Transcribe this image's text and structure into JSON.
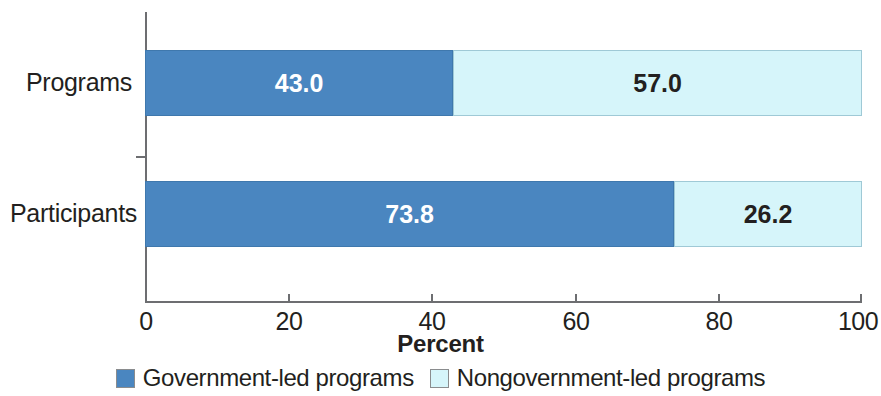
{
  "chart_data": {
    "type": "bar",
    "orientation": "horizontal",
    "stacked": true,
    "title": "",
    "xlabel": "Percent",
    "ylabel": "",
    "xlim": [
      0,
      100
    ],
    "xticks": [
      "0",
      "20",
      "40",
      "60",
      "80",
      "100"
    ],
    "grid": false,
    "legend_position": "bottom",
    "categories": [
      "Programs",
      "Participants"
    ],
    "series": [
      {
        "name": "Government-led programs",
        "color": "#4a86c0",
        "values": [
          43.0,
          73.8
        ],
        "labels": [
          "43.0",
          "73.8"
        ],
        "label_color": "#ffffff"
      },
      {
        "name": "Nongovernment-led programs",
        "color": "#d6f5fa",
        "values": [
          57.0,
          26.2
        ],
        "labels": [
          "57.0",
          "26.2"
        ],
        "label_color": "#231f20"
      }
    ]
  },
  "legend": {
    "items": [
      {
        "label": "Government-led programs",
        "color": "#4a86c0"
      },
      {
        "label": "Nongovernment-led programs",
        "color": "#d6f5fa"
      }
    ]
  },
  "axis": {
    "x_title": "Percent"
  }
}
